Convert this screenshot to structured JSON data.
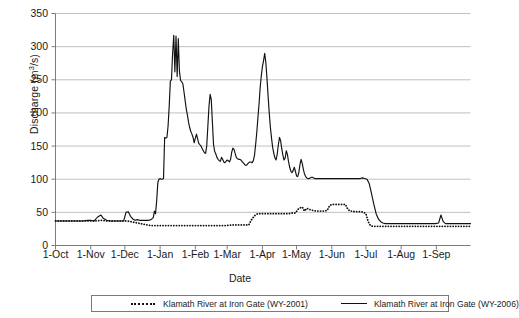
{
  "chart_data": {
    "type": "line",
    "title": "",
    "xlabel": "Date",
    "ylabel": "Discharge (m3/s)",
    "ylabel_parts": {
      "prefix": "Discharge (m",
      "sup": "3",
      "suffix": "/s)"
    },
    "ylim": [
      0,
      350
    ],
    "ytick_step": 50,
    "yticks": [
      0,
      50,
      100,
      150,
      200,
      250,
      300,
      350
    ],
    "xticks": [
      "1-Oct",
      "1-Nov",
      "1-Dec",
      "1-Jan",
      "1-Feb",
      "1-Mar",
      "1-Apr",
      "1-May",
      "1-Jun",
      "1-Jul",
      "1-Aug",
      "1-Sep"
    ],
    "xtick_day_offsets": [
      0,
      31,
      61,
      92,
      123,
      151,
      182,
      212,
      243,
      273,
      304,
      335
    ],
    "x_range_days": [
      0,
      365
    ],
    "grid": "horizontal",
    "legend_position": "bottom",
    "series": [
      {
        "name": "Klamath River at Iron Gate (WY-2001)",
        "style": "dotted",
        "color": "#111111",
        "points": [
          [
            0,
            37
          ],
          [
            5,
            37
          ],
          [
            10,
            37
          ],
          [
            15,
            37
          ],
          [
            20,
            37
          ],
          [
            25,
            37
          ],
          [
            30,
            37
          ],
          [
            35,
            37
          ],
          [
            40,
            38
          ],
          [
            45,
            37
          ],
          [
            50,
            37
          ],
          [
            55,
            37
          ],
          [
            60,
            37
          ],
          [
            63,
            37
          ],
          [
            66,
            36
          ],
          [
            69,
            35
          ],
          [
            72,
            34
          ],
          [
            75,
            33
          ],
          [
            78,
            32
          ],
          [
            81,
            31
          ],
          [
            84,
            30
          ],
          [
            87,
            30
          ],
          [
            90,
            30
          ],
          [
            95,
            30
          ],
          [
            100,
            30
          ],
          [
            105,
            30
          ],
          [
            110,
            30
          ],
          [
            115,
            30
          ],
          [
            120,
            30
          ],
          [
            125,
            30
          ],
          [
            130,
            30
          ],
          [
            135,
            30
          ],
          [
            140,
            30
          ],
          [
            145,
            30
          ],
          [
            150,
            30
          ],
          [
            155,
            31
          ],
          [
            160,
            31
          ],
          [
            165,
            31
          ],
          [
            170,
            31
          ],
          [
            172,
            38
          ],
          [
            175,
            45
          ],
          [
            178,
            48
          ],
          [
            181,
            48
          ],
          [
            184,
            48
          ],
          [
            187,
            48
          ],
          [
            190,
            48
          ],
          [
            193,
            48
          ],
          [
            196,
            48
          ],
          [
            199,
            48
          ],
          [
            202,
            48
          ],
          [
            205,
            48
          ],
          [
            208,
            49
          ],
          [
            211,
            49
          ],
          [
            214,
            56
          ],
          [
            217,
            58
          ],
          [
            219,
            52
          ],
          [
            221,
            56
          ],
          [
            223,
            55
          ],
          [
            225,
            53
          ],
          [
            227,
            53
          ],
          [
            229,
            52
          ],
          [
            231,
            52
          ],
          [
            233,
            52
          ],
          [
            235,
            52
          ],
          [
            237,
            52
          ],
          [
            239,
            53
          ],
          [
            241,
            60
          ],
          [
            243,
            62
          ],
          [
            245,
            62
          ],
          [
            247,
            62
          ],
          [
            249,
            62
          ],
          [
            251,
            62
          ],
          [
            253,
            62
          ],
          [
            255,
            62
          ],
          [
            257,
            55
          ],
          [
            259,
            52
          ],
          [
            261,
            52
          ],
          [
            263,
            51
          ],
          [
            265,
            51
          ],
          [
            267,
            51
          ],
          [
            269,
            51
          ],
          [
            271,
            50
          ],
          [
            273,
            48
          ],
          [
            275,
            36
          ],
          [
            277,
            30
          ],
          [
            279,
            29
          ],
          [
            281,
            29
          ],
          [
            283,
            29
          ],
          [
            288,
            29
          ],
          [
            293,
            29
          ],
          [
            298,
            29
          ],
          [
            303,
            29
          ],
          [
            308,
            29
          ],
          [
            313,
            29
          ],
          [
            318,
            29
          ],
          [
            323,
            29
          ],
          [
            328,
            29
          ],
          [
            333,
            29
          ],
          [
            338,
            29
          ],
          [
            343,
            29
          ],
          [
            348,
            29
          ],
          [
            353,
            29
          ],
          [
            358,
            29
          ],
          [
            365,
            29
          ]
        ]
      },
      {
        "name": "Klamath River at Iron Gate (WY-2006)",
        "style": "solid",
        "color": "#111111",
        "points": [
          [
            0,
            37
          ],
          [
            4,
            37
          ],
          [
            8,
            37
          ],
          [
            12,
            37
          ],
          [
            16,
            37
          ],
          [
            20,
            37
          ],
          [
            24,
            37
          ],
          [
            28,
            38
          ],
          [
            31,
            38
          ],
          [
            34,
            37
          ],
          [
            37,
            43
          ],
          [
            40,
            46
          ],
          [
            42,
            41
          ],
          [
            45,
            38
          ],
          [
            48,
            37
          ],
          [
            51,
            37
          ],
          [
            54,
            37
          ],
          [
            57,
            37
          ],
          [
            60,
            37
          ],
          [
            62,
            50
          ],
          [
            64,
            51
          ],
          [
            66,
            44
          ],
          [
            68,
            40
          ],
          [
            70,
            38
          ],
          [
            72,
            39
          ],
          [
            74,
            38
          ],
          [
            76,
            38
          ],
          [
            78,
            38
          ],
          [
            80,
            38
          ],
          [
            82,
            38
          ],
          [
            84,
            39
          ],
          [
            86,
            42
          ],
          [
            87,
            52
          ],
          [
            88,
            48
          ],
          [
            89,
            68
          ],
          [
            90,
            95
          ],
          [
            91,
            100
          ],
          [
            92,
            101
          ],
          [
            93,
            100
          ],
          [
            94,
            100
          ],
          [
            95,
            101
          ],
          [
            96,
            163
          ],
          [
            97,
            162
          ],
          [
            98,
            163
          ],
          [
            99,
            180
          ],
          [
            100,
            210
          ],
          [
            101,
            248
          ],
          [
            102,
            250
          ],
          [
            103,
            290
          ],
          [
            104,
            317
          ],
          [
            105,
            262
          ],
          [
            106,
            316
          ],
          [
            107,
            255
          ],
          [
            108,
            312
          ],
          [
            109,
            263
          ],
          [
            110,
            249
          ],
          [
            111,
            247
          ],
          [
            112,
            244
          ],
          [
            113,
            232
          ],
          [
            114,
            219
          ],
          [
            115,
            206
          ],
          [
            116,
            197
          ],
          [
            117,
            186
          ],
          [
            118,
            178
          ],
          [
            119,
            172
          ],
          [
            120,
            168
          ],
          [
            121,
            163
          ],
          [
            122,
            155
          ],
          [
            123,
            162
          ],
          [
            124,
            168
          ],
          [
            125,
            161
          ],
          [
            126,
            154
          ],
          [
            127,
            152
          ],
          [
            128,
            150
          ],
          [
            129,
            146
          ],
          [
            130,
            143
          ],
          [
            131,
            140
          ],
          [
            132,
            139
          ],
          [
            133,
            150
          ],
          [
            134,
            180
          ],
          [
            135,
            210
          ],
          [
            136,
            228
          ],
          [
            137,
            220
          ],
          [
            138,
            186
          ],
          [
            139,
            152
          ],
          [
            140,
            142
          ],
          [
            141,
            138
          ],
          [
            142,
            133
          ],
          [
            143,
            130
          ],
          [
            144,
            128
          ],
          [
            145,
            127
          ],
          [
            146,
            133
          ],
          [
            147,
            130
          ],
          [
            148,
            126
          ],
          [
            149,
            125
          ],
          [
            150,
            127
          ],
          [
            151,
            129
          ],
          [
            152,
            128
          ],
          [
            153,
            126
          ],
          [
            154,
            130
          ],
          [
            155,
            141
          ],
          [
            156,
            147
          ],
          [
            157,
            145
          ],
          [
            158,
            139
          ],
          [
            159,
            133
          ],
          [
            160,
            131
          ],
          [
            161,
            130
          ],
          [
            162,
            130
          ],
          [
            163,
            129
          ],
          [
            164,
            127
          ],
          [
            165,
            125
          ],
          [
            166,
            123
          ],
          [
            167,
            121
          ],
          [
            168,
            121
          ],
          [
            169,
            123
          ],
          [
            170,
            125
          ],
          [
            171,
            126
          ],
          [
            172,
            126
          ],
          [
            173,
            125
          ],
          [
            174,
            128
          ],
          [
            175,
            136
          ],
          [
            176,
            152
          ],
          [
            177,
            170
          ],
          [
            178,
            192
          ],
          [
            179,
            213
          ],
          [
            180,
            238
          ],
          [
            181,
            256
          ],
          [
            182,
            270
          ],
          [
            183,
            279
          ],
          [
            184,
            290
          ],
          [
            185,
            276
          ],
          [
            186,
            252
          ],
          [
            187,
            225
          ],
          [
            188,
            200
          ],
          [
            189,
            178
          ],
          [
            190,
            162
          ],
          [
            191,
            148
          ],
          [
            192,
            139
          ],
          [
            193,
            132
          ],
          [
            194,
            129
          ],
          [
            195,
            138
          ],
          [
            196,
            152
          ],
          [
            197,
            163
          ],
          [
            198,
            158
          ],
          [
            199,
            146
          ],
          [
            200,
            136
          ],
          [
            201,
            129
          ],
          [
            202,
            132
          ],
          [
            203,
            143
          ],
          [
            204,
            137
          ],
          [
            205,
            126
          ],
          [
            206,
            118
          ],
          [
            207,
            112
          ],
          [
            208,
            110
          ],
          [
            209,
            113
          ],
          [
            210,
            118
          ],
          [
            211,
            112
          ],
          [
            212,
            105
          ],
          [
            213,
            104
          ],
          [
            214,
            110
          ],
          [
            215,
            122
          ],
          [
            216,
            130
          ],
          [
            217,
            124
          ],
          [
            218,
            115
          ],
          [
            219,
            108
          ],
          [
            220,
            104
          ],
          [
            221,
            102
          ],
          [
            222,
            101
          ],
          [
            223,
            101
          ],
          [
            224,
            102
          ],
          [
            225,
            103
          ],
          [
            226,
            103
          ],
          [
            227,
            102
          ],
          [
            228,
            101
          ],
          [
            229,
            101
          ],
          [
            230,
            101
          ],
          [
            235,
            101
          ],
          [
            240,
            101
          ],
          [
            245,
            101
          ],
          [
            250,
            101
          ],
          [
            255,
            101
          ],
          [
            260,
            101
          ],
          [
            265,
            101
          ],
          [
            268,
            101
          ],
          [
            270,
            102
          ],
          [
            272,
            101
          ],
          [
            274,
            100
          ],
          [
            276,
            93
          ],
          [
            278,
            78
          ],
          [
            280,
            62
          ],
          [
            282,
            48
          ],
          [
            284,
            40
          ],
          [
            286,
            36
          ],
          [
            288,
            34
          ],
          [
            290,
            33
          ],
          [
            293,
            33
          ],
          [
            296,
            33
          ],
          [
            300,
            33
          ],
          [
            305,
            33
          ],
          [
            310,
            33
          ],
          [
            315,
            33
          ],
          [
            320,
            33
          ],
          [
            325,
            33
          ],
          [
            330,
            33
          ],
          [
            334,
            33
          ],
          [
            337,
            34
          ],
          [
            339,
            46
          ],
          [
            341,
            36
          ],
          [
            343,
            33
          ],
          [
            346,
            33
          ],
          [
            350,
            33
          ],
          [
            355,
            33
          ],
          [
            360,
            33
          ],
          [
            365,
            33
          ]
        ]
      }
    ]
  },
  "legend": {
    "entries": [
      {
        "label": "Klamath River at Iron Gate (WY-2001)",
        "style": "dotted"
      },
      {
        "label": "Klamath River at Iron Gate (WY-2006)",
        "style": "solid"
      }
    ]
  }
}
